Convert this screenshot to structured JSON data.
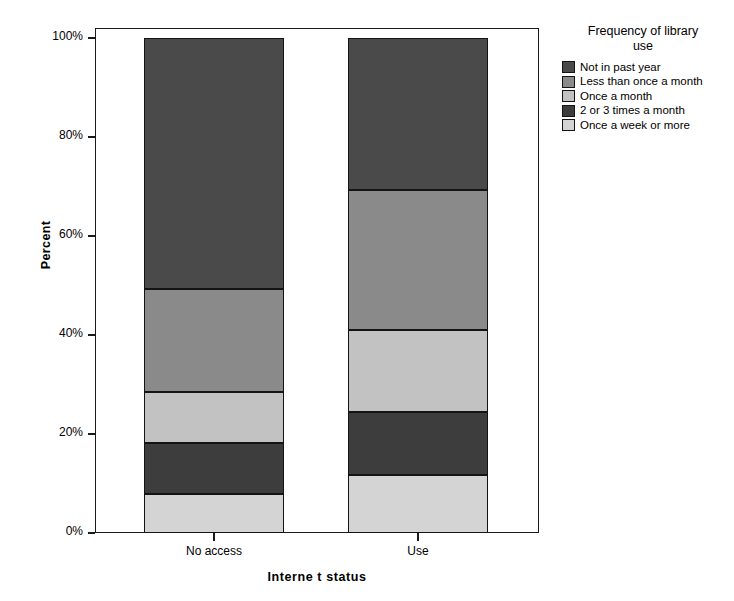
{
  "chart_data": {
    "type": "bar",
    "subtype": "stacked-100-percent",
    "title": "",
    "xlabel": "Interne t status",
    "ylabel": "Percent",
    "categories": [
      "No access",
      "Use"
    ],
    "ylim": [
      0,
      100
    ],
    "ytick_labels": [
      "0%",
      "20%",
      "40%",
      "60%",
      "80%",
      "100%"
    ],
    "ytick_values": [
      0,
      20,
      40,
      60,
      80,
      100
    ],
    "grid": false,
    "legend_position": "right",
    "legend_title": "Frequency of library use",
    "series": [
      {
        "name": "Once a week or more",
        "color": "#d4d4d4",
        "values": [
          7.9,
          11.7
        ]
      },
      {
        "name": "2 or 3 times a month",
        "color": "#3d3d3d",
        "values": [
          10.3,
          12.7
        ]
      },
      {
        "name": "Once a month",
        "color": "#c2c2c2",
        "values": [
          10.3,
          16.6
        ]
      },
      {
        "name": "Less than once a month",
        "color": "#8a8a8a",
        "values": [
          20.8,
          28.3
        ]
      },
      {
        "name": "Not in past year",
        "color": "#4a4a4a",
        "values": [
          50.7,
          30.7
        ]
      }
    ],
    "cumulative_boundaries": {
      "No access": [
        0,
        7.9,
        18.2,
        28.5,
        49.3,
        100
      ],
      "Use": [
        0,
        11.7,
        24.4,
        41.0,
        69.3,
        100
      ]
    }
  },
  "legend": {
    "title_line_1": "Frequency of library",
    "title_line_2": "use",
    "items": [
      {
        "label": "Not in past year",
        "color": "#4a4a4a"
      },
      {
        "label": "Less than once a month",
        "color": "#8a8a8a"
      },
      {
        "label": "Once a month",
        "color": "#c2c2c2"
      },
      {
        "label": "2 or 3 times a month",
        "color": "#3d3d3d"
      },
      {
        "label": "Once a week or more",
        "color": "#d4d4d4"
      }
    ]
  },
  "axes": {
    "y_title": "Percent",
    "x_title": "Interne t status",
    "y_ticks": [
      "100%",
      "80%",
      "60%",
      "40%",
      "20%",
      "0%"
    ],
    "x_ticks": [
      "No access",
      "Use"
    ]
  }
}
